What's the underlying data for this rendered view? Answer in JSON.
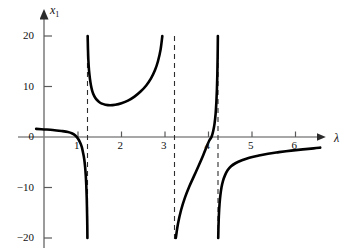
{
  "chart_data": {
    "type": "line",
    "title": "",
    "subtitle": "",
    "xlabel": "λ",
    "ylabel": "x₁",
    "ylabel_base": "x",
    "ylabel_sub": "1",
    "xlim": [
      -0.18,
      6.45
    ],
    "ylim": [
      -20,
      20
    ],
    "grid": false,
    "legend": null,
    "annotations": [],
    "curve_color": "#000000",
    "axis_color": "#808080",
    "asymptote_color": "#333333",
    "xticks": [
      1,
      2,
      3,
      4,
      5,
      6
    ],
    "xtick_labels": [
      "1",
      "2",
      "3",
      "4",
      "5",
      "6"
    ],
    "yticks": [
      20,
      10,
      0,
      -10,
      -20
    ],
    "ytick_labels": [
      "20",
      "10",
      "0",
      "−10",
      "−20"
    ],
    "asymptotes": [
      1,
      3,
      4
    ],
    "zero_crossings": [
      3.85
    ],
    "series": [
      {
        "name": "branch-1",
        "comment": "left branch: from x1 = 1.5 at lambda = -0.18 down to -20 at lambda = 1",
        "x": [
          -0.18,
          0.0,
          0.2,
          0.4,
          0.55,
          0.65,
          0.72,
          0.78,
          0.83,
          0.87,
          0.9,
          0.925,
          0.945,
          0.96,
          0.972,
          0.982,
          0.99,
          0.995,
          0.998
        ],
        "y": [
          1.6,
          1.5,
          1.4,
          1.2,
          1.0,
          0.7,
          0.3,
          -0.3,
          -1.1,
          -2.0,
          -3.2,
          -4.4,
          -5.9,
          -7.6,
          -9.6,
          -12.0,
          -15.0,
          -17.5,
          -20.0
        ]
      },
      {
        "name": "branch-2",
        "comment": "middle U branch between asymptotes lambda = 1 and lambda = 3, minimum x1 = 6.3 near lambda = 1.52",
        "x": [
          1.004,
          1.01,
          1.02,
          1.035,
          1.055,
          1.08,
          1.11,
          1.15,
          1.2,
          1.26,
          1.33,
          1.41,
          1.52,
          1.64,
          1.78,
          1.93,
          2.08,
          2.22,
          2.35,
          2.46,
          2.55,
          2.62,
          2.68,
          2.72
        ],
        "y": [
          20.0,
          17.6,
          15.2,
          13.2,
          11.6,
          10.2,
          9.1,
          8.2,
          7.5,
          7.0,
          6.6,
          6.4,
          6.3,
          6.4,
          6.7,
          7.2,
          8.0,
          9.0,
          10.2,
          11.6,
          13.2,
          15.0,
          17.3,
          20.0
        ]
      },
      {
        "name": "branch-3",
        "comment": "branch between asymptotes lambda = 3 and lambda = 4, crosses zero at lambda = 3.85, steeply rising",
        "x": [
          3.03,
          3.08,
          3.15,
          3.24,
          3.34,
          3.45,
          3.56,
          3.66,
          3.74,
          3.8,
          3.85,
          3.89,
          3.92,
          3.945,
          3.962,
          3.975,
          3.985,
          3.992,
          3.997
        ],
        "y": [
          -20.0,
          -17.2,
          -14.5,
          -12.0,
          -9.8,
          -7.7,
          -5.6,
          -3.6,
          -1.9,
          -0.7,
          0.0,
          1.2,
          2.6,
          4.6,
          6.8,
          9.4,
          12.4,
          16.0,
          20.0
        ]
      },
      {
        "name": "branch-4",
        "comment": "right branch past asymptote lambda = 4, rising from -20 toward x1 = -2 at lambda = 6.35",
        "x": [
          4.005,
          4.012,
          4.022,
          4.036,
          4.055,
          4.08,
          4.115,
          4.16,
          4.22,
          4.3,
          4.4,
          4.55,
          4.72,
          4.92,
          5.15,
          5.4,
          5.68,
          5.95,
          6.2,
          6.35
        ],
        "y": [
          -20.0,
          -17.5,
          -15.2,
          -13.2,
          -11.5,
          -10.0,
          -8.7,
          -7.6,
          -6.6,
          -5.8,
          -5.2,
          -4.6,
          -4.1,
          -3.7,
          -3.3,
          -3.0,
          -2.7,
          -2.45,
          -2.25,
          -2.1
        ]
      }
    ]
  },
  "axes": {
    "x_axis_name": "λ",
    "y_axis_name_base": "x",
    "y_axis_name_sub": "1"
  },
  "ytick_text": {
    "t20": "20",
    "t10": "10",
    "t0": "0",
    "tm10": "−10",
    "tm20": "−20"
  },
  "xtick_text": {
    "t1": "1",
    "t2": "2",
    "t3": "3",
    "t4": "4",
    "t5": "5",
    "t6": "6"
  }
}
